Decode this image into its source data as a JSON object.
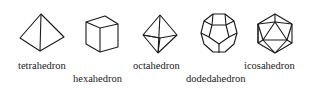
{
  "solids": [
    {
      "name": "tetrahedron",
      "label": "tetrahedron"
    },
    {
      "name": "hexahedron",
      "label": "hexahedron"
    },
    {
      "name": "octahedron",
      "label": "octahedron"
    },
    {
      "name": "dodecahedron",
      "label": "dodedahedron"
    },
    {
      "name": "icosahedron",
      "label": "icosahedron"
    }
  ]
}
